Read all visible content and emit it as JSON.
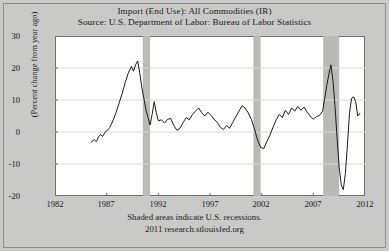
{
  "title": "Import (End Use): All Commodities (IR)",
  "subtitle": "Source: U.S. Department of Labor: Bureau of Labor Statistics",
  "footer": {
    "recession_note": "Shaded areas indicate U.S. recessions.",
    "attribution": "2011 research.stlouisfed.org"
  },
  "colors": {
    "background": "#c9c9c7",
    "plot_background": "#ffffff",
    "line": "#1a1a1a",
    "recession_band": "#b9b9b7",
    "gridline": "#d8d8d8",
    "axis": "#6f6f6d"
  },
  "chart_data": {
    "type": "line",
    "title": "Import (End Use): All Commodities (IR)",
    "subtitle": "Source: U.S. Department of Labor: Bureau of Labor Statistics",
    "xlabel": "",
    "ylabel": "(Percent change from year ago)",
    "xlim": [
      1982,
      2012
    ],
    "ylim": [
      -20,
      30
    ],
    "xticks": [
      1982,
      1987,
      1992,
      1997,
      2002,
      2007,
      2012
    ],
    "yticks": [
      30,
      20,
      10,
      0,
      -10,
      -20
    ],
    "grid": true,
    "legend": null,
    "recessions": [
      {
        "start": 1990.5,
        "end": 1991.2
      },
      {
        "start": 2001.2,
        "end": 2001.9
      },
      {
        "start": 2007.95,
        "end": 2009.5
      }
    ],
    "series": [
      {
        "name": "Import (End Use): All Commodities (IR)",
        "x": [
          1985.5,
          1985.8,
          1986.0,
          1986.2,
          1986.4,
          1986.6,
          1986.9,
          1987.1,
          1987.3,
          1987.6,
          1987.9,
          1988.2,
          1988.5,
          1988.8,
          1989.1,
          1989.4,
          1989.6,
          1989.8,
          1990.0,
          1990.2,
          1990.4,
          1990.6,
          1990.8,
          1991.0,
          1991.2,
          1991.4,
          1991.6,
          1991.8,
          1992.0,
          1992.3,
          1992.6,
          1992.9,
          1993.2,
          1993.5,
          1993.8,
          1994.1,
          1994.4,
          1994.7,
          1995.0,
          1995.3,
          1995.6,
          1995.9,
          1996.2,
          1996.5,
          1996.8,
          1997.1,
          1997.4,
          1997.7,
          1998.0,
          1998.3,
          1998.6,
          1998.9,
          1999.2,
          1999.5,
          1999.8,
          2000.1,
          2000.4,
          2000.7,
          2001.0,
          2001.3,
          2001.6,
          2001.9,
          2002.2,
          2002.5,
          2002.8,
          2003.1,
          2003.4,
          2003.7,
          2004.0,
          2004.3,
          2004.6,
          2004.9,
          2005.2,
          2005.5,
          2005.8,
          2006.1,
          2006.4,
          2006.7,
          2007.0,
          2007.3,
          2007.6,
          2007.9,
          2008.1,
          2008.3,
          2008.5,
          2008.7,
          2008.9,
          2009.1,
          2009.3,
          2009.5,
          2009.7,
          2009.9,
          2010.1,
          2010.3,
          2010.5,
          2010.7,
          2010.9,
          2011.1,
          2011.3,
          2011.5
        ],
        "y": [
          -3.2,
          -2.4,
          -3.0,
          -1.6,
          -0.8,
          -1.4,
          0.2,
          0.6,
          1.4,
          3.5,
          6.0,
          9.0,
          12.0,
          15.5,
          18.5,
          20.5,
          19.0,
          21.0,
          22.2,
          18.5,
          14.0,
          10.5,
          7.0,
          4.5,
          2.2,
          5.5,
          9.5,
          6.0,
          3.5,
          3.8,
          2.8,
          4.0,
          4.2,
          2.0,
          0.5,
          1.2,
          3.0,
          4.5,
          3.8,
          5.5,
          6.5,
          7.5,
          6.0,
          5.0,
          6.2,
          5.2,
          4.0,
          3.0,
          1.5,
          0.8,
          2.0,
          1.2,
          3.0,
          4.8,
          6.5,
          8.2,
          7.5,
          6.0,
          4.0,
          1.0,
          -2.5,
          -4.8,
          -5.2,
          -3.0,
          -1.0,
          1.5,
          3.8,
          5.5,
          4.5,
          6.8,
          5.5,
          7.5,
          6.5,
          8.0,
          6.8,
          7.8,
          6.2,
          5.0,
          4.0,
          4.8,
          5.2,
          6.5,
          10.5,
          14.5,
          18.0,
          21.0,
          16.0,
          8.0,
          -2.0,
          -11.0,
          -16.5,
          -18.0,
          -13.0,
          -4.0,
          6.0,
          10.5,
          11.0,
          9.5,
          5.0,
          5.8
        ]
      }
    ]
  },
  "axis": {
    "y_label": "(Percent change from year ago)",
    "y_ticks": [
      "30",
      "20",
      "10",
      "0",
      "-10",
      "-20"
    ],
    "x_ticks": [
      "1982",
      "1987",
      "1992",
      "1997",
      "2002",
      "2007",
      "2012"
    ]
  }
}
